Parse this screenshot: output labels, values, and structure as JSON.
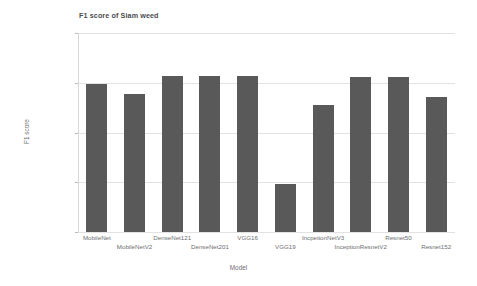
{
  "chart_data": {
    "type": "bar",
    "title": "F1 score of Siam weed",
    "xlabel": "Model",
    "ylabel": "F1 score",
    "ylim": [
      0.8,
      1.0
    ],
    "yticks": [
      0.8,
      0.85,
      0.9,
      0.95,
      1
    ],
    "ytick_labels": [
      "0.8",
      "0.85",
      "0.9",
      "0.95",
      "1"
    ],
    "grid": true,
    "legend": null,
    "bar_color": "#595959",
    "categories": [
      "MobileNet",
      "MobileNetV2",
      "DenseNet121",
      "DenseNet201",
      "VGG16",
      "VGG19",
      "IncpetionNetV3",
      "InceptionResnetV2",
      "Resnet50",
      "Resnet152"
    ],
    "values": [
      0.949,
      0.939,
      0.957,
      0.957,
      0.957,
      0.848,
      0.928,
      0.956,
      0.956,
      0.936
    ]
  }
}
